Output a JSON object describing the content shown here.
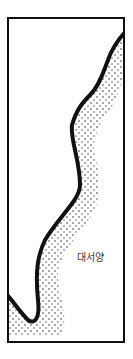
{
  "map": {
    "ocean_label": "대서양",
    "colors": {
      "ink": "#111111",
      "background": "#ffffff"
    }
  }
}
